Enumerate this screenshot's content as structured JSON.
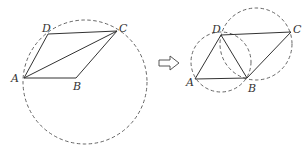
{
  "figure_left": {
    "points": {
      "A": "A",
      "B": "B",
      "C": "C",
      "D": "D"
    }
  },
  "figure_right": {
    "points": {
      "A": "A",
      "B": "B",
      "C": "C",
      "D": "D"
    }
  },
  "arrow": "implies-arrow"
}
